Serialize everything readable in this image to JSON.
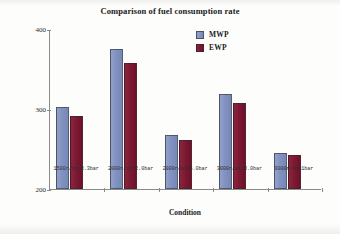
{
  "chart_data": {
    "type": "bar",
    "title": "Comparison of fuel consumption rate",
    "xlabel": "Condition",
    "ylabel": "Fuel consumption rate(g/(kW·h))",
    "categories": [
      "1500r/min3.3bar",
      "2000r/min2.0bar",
      "2000r/min5.0bar",
      "3000r/min3.0bar",
      "3000r/min1bar"
    ],
    "series": [
      {
        "name": "MWP",
        "color": "#8192c0",
        "values": [
          303,
          375,
          268,
          319,
          245
        ]
      },
      {
        "name": "EWP",
        "color": "#7d1a33",
        "values": [
          291,
          358,
          261,
          308,
          242
        ]
      }
    ],
    "ylim": [
      200,
      400
    ],
    "yticks": [
      200,
      300,
      400
    ],
    "ytick_labels": [
      "200",
      "300",
      "400"
    ],
    "grid": false,
    "legend_position": "top-right"
  },
  "legend": {
    "entries": [
      {
        "label": "MWP"
      },
      {
        "label": "EWP"
      }
    ]
  }
}
